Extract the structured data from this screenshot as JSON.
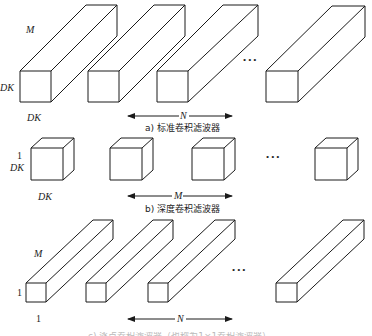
{
  "panels": {
    "a": {
      "caption": "a) 标准卷积滤波器",
      "label_depth": "M",
      "label_height": "DK",
      "label_width": "DK",
      "label_count": "N",
      "ellipsis": "•••"
    },
    "b": {
      "caption": "b) 深度卷积滤波器",
      "label_depth": "1",
      "label_height": "DK",
      "label_width": "DK",
      "label_count": "M",
      "ellipsis": "•••"
    },
    "c": {
      "caption": "c) 逐点卷积滤波器（也称为1×1卷积滤波器）",
      "label_depth": "M",
      "label_height": "1",
      "label_width": "1",
      "label_count": "N",
      "ellipsis": "•••"
    }
  },
  "colors": {
    "stroke": "#1a1a1a",
    "background": "#ffffff"
  }
}
